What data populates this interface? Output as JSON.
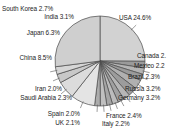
{
  "chart_data": {
    "type": "pie",
    "title": "",
    "subtitle": "",
    "xlabel": "",
    "ylabel": "",
    "legend_position": "none",
    "grid": false,
    "labels_show_percent": true,
    "start_angle_deg": 0,
    "direction": "clockwise",
    "categories": [
      "USA",
      "Canada",
      "Mexico",
      "Brazil",
      "Russia",
      "Germany",
      "France",
      "Italy",
      "UK",
      "Spain",
      "Saudi Arabia",
      "Iran",
      "China",
      "Japan",
      "India",
      "South Korea",
      "Other"
    ],
    "values": [
      24.6,
      2.4,
      2.2,
      2.3,
      3.2,
      3.2,
      2.4,
      2.2,
      2.1,
      2.0,
      2.3,
      2.0,
      8.5,
      6.3,
      3.1,
      2.7,
      26.5
    ],
    "slices": [
      {
        "name": "USA",
        "label": "USA 24.6%",
        "value": 24.6,
        "color": "#d2d2d2",
        "truncated": false
      },
      {
        "name": "Canada",
        "label": "Canada 2.",
        "value": 2.4,
        "color": "#9a9a9a",
        "truncated": true
      },
      {
        "name": "Mexico",
        "label": "Mexico 2.2",
        "value": 2.2,
        "color": "#b4b4b4",
        "truncated": true
      },
      {
        "name": "Brazil",
        "label": "Brazil 2.3%",
        "value": 2.3,
        "color": "#9a9a9a",
        "truncated": false
      },
      {
        "name": "Russia",
        "label": "Russia 3.2%",
        "value": 3.2,
        "color": "#b0b0b0",
        "truncated": false
      },
      {
        "name": "Germany",
        "label": "Germany 3.2%",
        "value": 3.2,
        "color": "#9c9c9c",
        "truncated": false
      },
      {
        "name": "France",
        "label": "France 2.4%",
        "value": 2.4,
        "color": "#b6b6b6",
        "truncated": false
      },
      {
        "name": "Italy",
        "label": "Italy 2.2%",
        "value": 2.2,
        "color": "#a0a0a0",
        "truncated": false
      },
      {
        "name": "UK",
        "label": "UK 2.1%",
        "value": 2.1,
        "color": "#bcbcbc",
        "truncated": false
      },
      {
        "name": "Spain",
        "label": "Spain 2.0%",
        "value": 2.0,
        "color": "#a6a6a6",
        "truncated": false
      },
      {
        "name": "Saudi Arabia",
        "label": "Saudi Arabia 2.3%",
        "value": 2.3,
        "color": "#c0c0c0",
        "truncated": false
      },
      {
        "name": "Iran",
        "label": "Iran 2.0%",
        "value": 2.0,
        "color": "#acacac",
        "truncated": false
      },
      {
        "name": "China",
        "label": "China 8.5%",
        "value": 8.5,
        "color": "#e4e4e4",
        "truncated": false
      },
      {
        "name": "Japan",
        "label": "Japan 6.3%",
        "value": 6.3,
        "color": "#dcdcdc",
        "truncated": false
      },
      {
        "name": "India",
        "label": "India 3.1%",
        "value": 3.1,
        "color": "#c8c8c8",
        "truncated": false
      },
      {
        "name": "South Korea",
        "label": "South Korea 2.7%",
        "value": 2.7,
        "color": "#d6d6d6",
        "truncated": false
      },
      {
        "name": "Other",
        "label": "",
        "value": 26.5,
        "color": "#cfcfcf",
        "truncated": false
      }
    ]
  },
  "labels": {
    "usa": "USA 24.6%",
    "canada": "Canada 2.",
    "mexico": "Mexico 2.2",
    "brazil": "Brazil 2.3%",
    "russia": "Russia 3.2%",
    "germany": "Germany 3.2%",
    "france": "France 2.4%",
    "italy": "Italy 2.2%",
    "uk": "UK 2.1%",
    "spain": "Spain 2.0%",
    "saudi_arabia": "Saudi Arabia 2.3%",
    "iran": "Iran 2.0%",
    "china": "China 8.5%",
    "japan": "Japan 6.3%",
    "india": "India 3.1%",
    "south_korea": "South Korea 2.7%"
  },
  "style": {
    "background": "#ffffff",
    "slice_border": "#4a4a4a",
    "text_color": "#1c1c1c",
    "leader_color": "#5a5a5a"
  },
  "geometry": {
    "center_x": 100,
    "center_y": 61,
    "radius": 45
  }
}
